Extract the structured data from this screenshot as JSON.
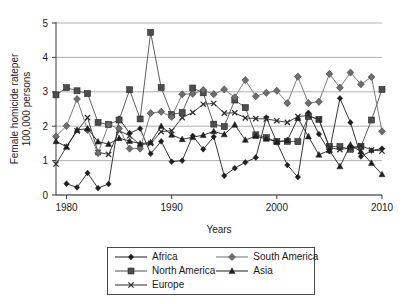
{
  "chart_data": {
    "type": "line",
    "title": "",
    "xlabel": "Years",
    "ylabel": "Female homicide rateper 100,000 persons",
    "ylabel_line1": "Female homicide rateper",
    "ylabel_line2": "100,000 persons",
    "xlim": [
      1979,
      2010
    ],
    "ylim": [
      0,
      5
    ],
    "yticks": [
      0,
      1,
      2,
      3,
      4,
      5
    ],
    "ytick_labels": [
      "0",
      "1",
      "2",
      "3",
      "4",
      "5"
    ],
    "xticks": [
      1980,
      1990,
      2000,
      2010
    ],
    "xtick_labels": [
      "1980",
      "1990",
      "2000",
      "2010"
    ],
    "grid": "horizontal",
    "legend_position": "bottom-outside",
    "x": [
      1979,
      1980,
      1981,
      1982,
      1983,
      1984,
      1985,
      1986,
      1987,
      1988,
      1989,
      1990,
      1991,
      1992,
      1993,
      1994,
      1995,
      1996,
      1997,
      1998,
      1999,
      2000,
      2001,
      2002,
      2003,
      2004,
      2005,
      2006,
      2007,
      2008,
      2009,
      2010
    ],
    "series": [
      {
        "name": "Africa",
        "marker": "diamond",
        "color": "#1f1f1f",
        "x": [
          1980,
          1981,
          1982,
          1983,
          1984,
          1985,
          1986,
          1987,
          1988,
          1989,
          1990,
          1991,
          1992,
          1993,
          1994,
          1995,
          1996,
          1997,
          1998,
          1999,
          2000,
          2001,
          2002,
          2003,
          2004,
          2005,
          2006,
          2007,
          2008,
          2009,
          2010
        ],
        "values": [
          0.33,
          0.22,
          0.64,
          0.2,
          0.32,
          2.22,
          1.8,
          1.93,
          1.2,
          1.56,
          0.97,
          1.0,
          1.72,
          1.33,
          1.69,
          0.56,
          0.78,
          0.95,
          1.09,
          2.25,
          1.53,
          0.87,
          0.52,
          2.39,
          1.77,
          1.27,
          2.81,
          2.11,
          1.12,
          1.29,
          1.35
        ]
      },
      {
        "name": "North America",
        "marker": "square",
        "color": "#4d4d4d",
        "x": [
          1979,
          1980,
          1981,
          1982,
          1983,
          1984,
          1985,
          1986,
          1987,
          1988,
          1989,
          1990,
          1991,
          1992,
          1993,
          1994,
          1995,
          1996,
          1997,
          1998,
          1999,
          2000,
          2001,
          2002,
          2003,
          2004,
          2005,
          2006,
          2007,
          2008,
          2009,
          2010
        ],
        "values": [
          2.91,
          3.12,
          3.03,
          2.95,
          2.11,
          2.05,
          2.18,
          3.06,
          2.21,
          4.73,
          3.12,
          2.34,
          2.4,
          3.11,
          2.97,
          2.06,
          1.99,
          2.76,
          2.54,
          1.75,
          1.67,
          1.55,
          1.56,
          1.55,
          2.28,
          2.2,
          1.41,
          1.41,
          1.33,
          1.41,
          2.18,
          3.07
        ]
      },
      {
        "name": "Europe",
        "marker": "x",
        "color": "#2b2b2b",
        "x": [
          1979,
          1980,
          1981,
          1982,
          1983,
          1984,
          1985,
          1986,
          1987,
          1988,
          1989,
          1990,
          1991,
          1992,
          1993,
          1994,
          1995,
          1996,
          1997,
          1998,
          1999,
          2000,
          2001,
          2002,
          2003,
          2004,
          2005,
          2006,
          2007,
          2008,
          2009,
          2010
        ],
        "values": [
          0.9,
          1.4,
          1.86,
          2.25,
          1.24,
          1.18,
          1.87,
          1.72,
          1.46,
          1.5,
          1.84,
          1.87,
          2.25,
          2.4,
          2.64,
          2.66,
          2.38,
          2.39,
          2.24,
          2.22,
          2.21,
          2.16,
          2.11,
          2.28,
          2.31,
          2.19,
          1.38,
          1.32,
          1.37,
          1.43,
          1.31,
          1.28
        ]
      },
      {
        "name": "South America",
        "marker": "diamond-gray",
        "color": "#6e6e6e",
        "x": [
          1979,
          1980,
          1981,
          1982,
          1983,
          1984,
          1985,
          1986,
          1987,
          1988,
          1989,
          1990,
          1991,
          1992,
          1993,
          1994,
          1995,
          1996,
          1997,
          1998,
          1999,
          2000,
          2001,
          2002,
          2003,
          2004,
          2005,
          2006,
          2007,
          2008,
          2009,
          2010
        ],
        "values": [
          1.7,
          2.01,
          2.79,
          1.89,
          1.22,
          2.05,
          1.93,
          1.35,
          1.35,
          2.38,
          2.42,
          2.27,
          2.93,
          2.94,
          3.05,
          2.93,
          3.07,
          2.84,
          3.34,
          2.87,
          2.97,
          3.03,
          2.67,
          3.44,
          2.67,
          2.71,
          3.52,
          3.12,
          3.56,
          3.22,
          3.43,
          1.85
        ]
      },
      {
        "name": "Asia",
        "marker": "triangle",
        "color": "#1f1f1f",
        "x": [
          1979,
          1980,
          1981,
          1982,
          1983,
          1984,
          1985,
          1986,
          1987,
          1988,
          1989,
          1990,
          1991,
          1992,
          1993,
          1994,
          1995,
          1996,
          1997,
          1998,
          1999,
          2000,
          2001,
          2002,
          2003,
          2004,
          2005,
          2006,
          2007,
          2008,
          2009,
          2010
        ],
        "values": [
          1.56,
          1.4,
          1.89,
          1.93,
          1.55,
          1.48,
          1.65,
          1.57,
          1.49,
          1.53,
          2.0,
          1.75,
          1.62,
          1.68,
          1.74,
          1.85,
          1.76,
          2.04,
          1.6,
          1.71,
          1.63,
          1.55,
          1.59,
          2.23,
          1.7,
          1.17,
          1.3,
          0.83,
          1.46,
          1.26,
          0.93,
          0.6
        ]
      }
    ]
  },
  "legend": {
    "entries": [
      {
        "label": "Africa",
        "marker": "diamond",
        "color": "#1f1f1f"
      },
      {
        "label": "South America",
        "marker": "diamond-gray",
        "color": "#6e6e6e"
      },
      {
        "label": "North America",
        "marker": "square",
        "color": "#4d4d4d"
      },
      {
        "label": "Asia",
        "marker": "triangle",
        "color": "#1f1f1f"
      },
      {
        "label": "Europe",
        "marker": "x",
        "color": "#2b2b2b"
      }
    ]
  },
  "colors": {
    "background": "#ffffff",
    "axis": "#3a3a3a",
    "grid": "#a8a8a8",
    "text": "#1a1a1a"
  }
}
